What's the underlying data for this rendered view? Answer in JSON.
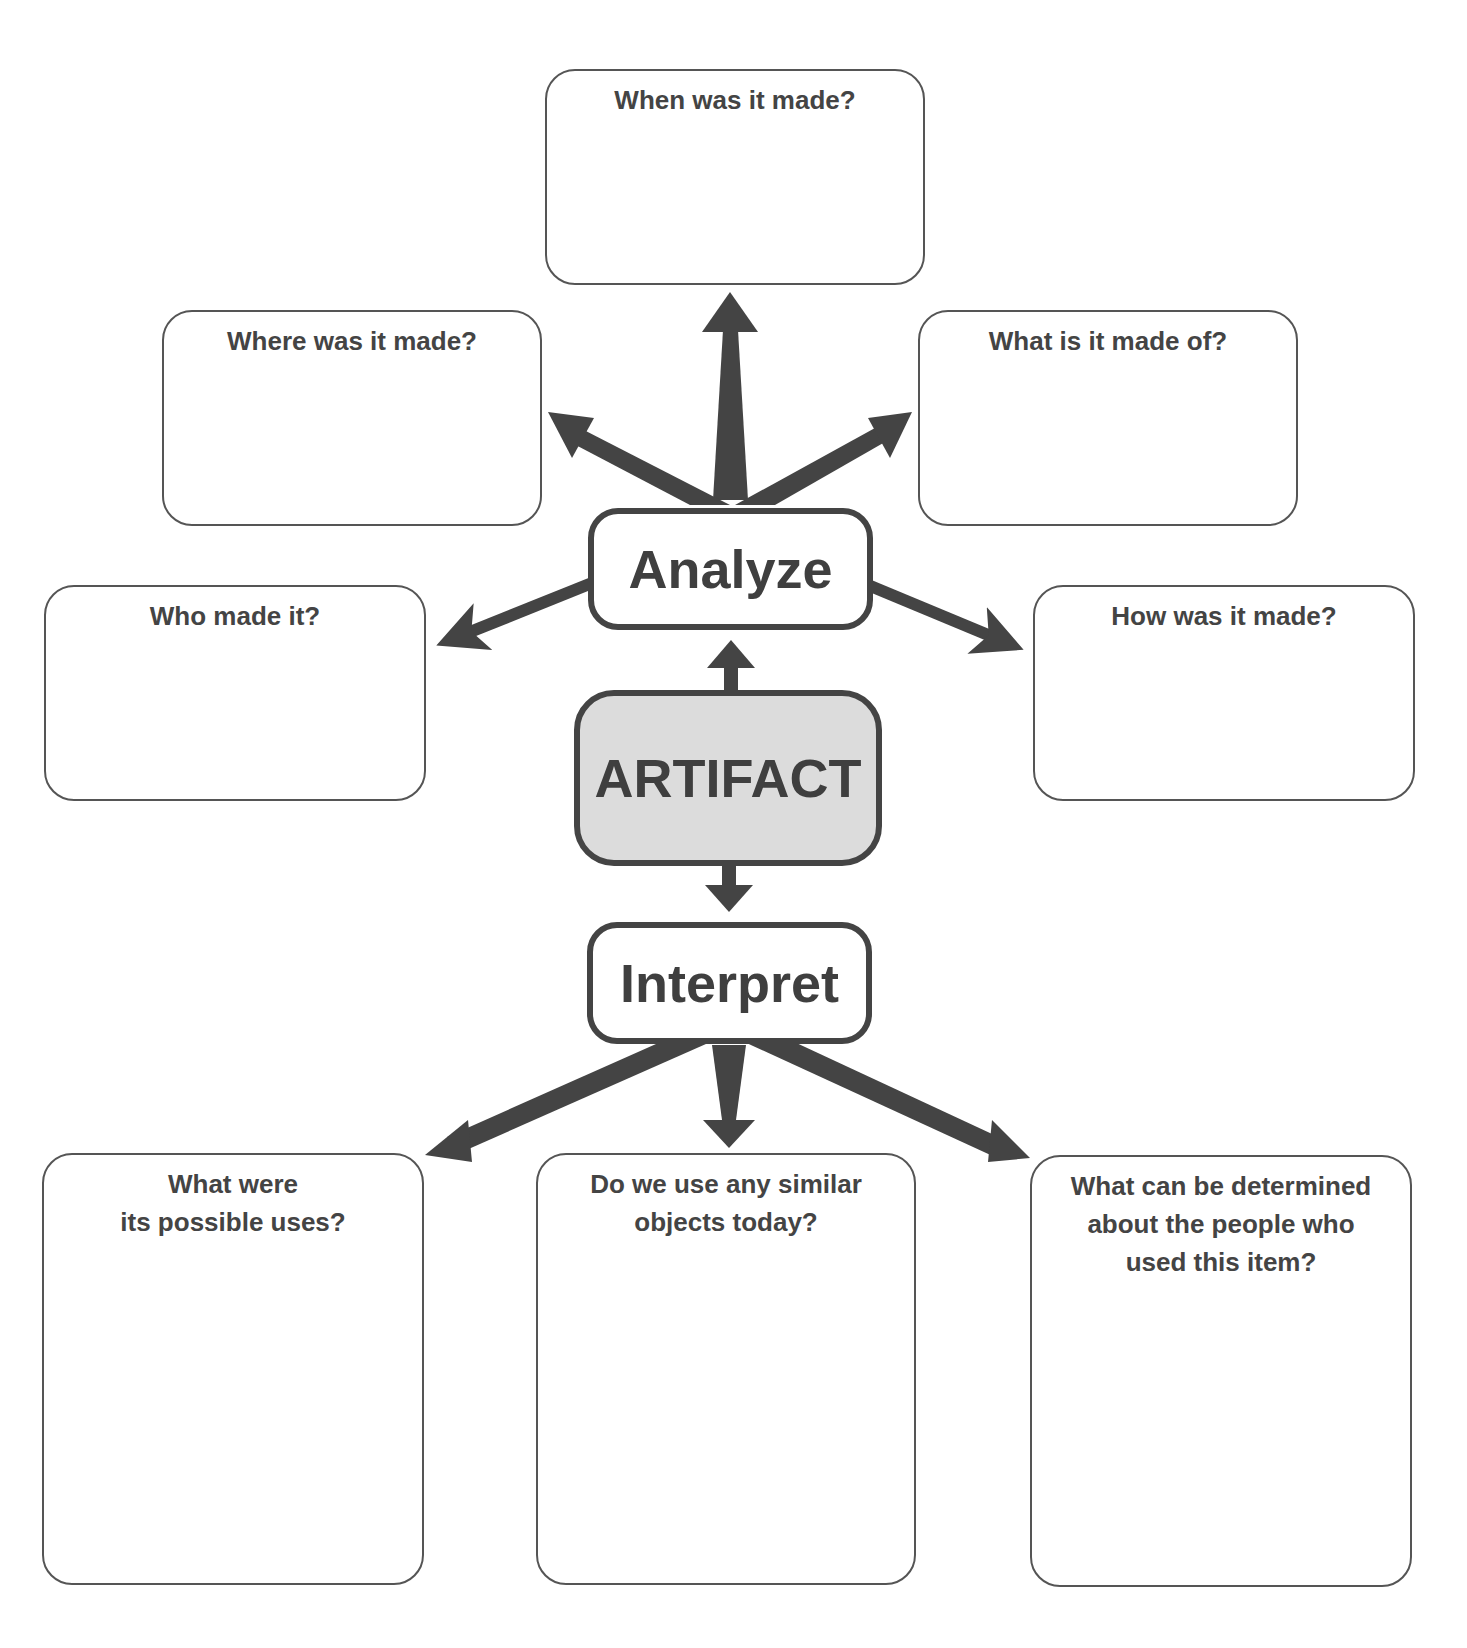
{
  "diagram": {
    "colors": {
      "arrow": "#444444",
      "box_border": "#555555",
      "text": "#444444",
      "artifact_fill": "#dcdcdc"
    },
    "center": {
      "label": "ARTIFACT"
    },
    "analyze": {
      "label": "Analyze",
      "questions": [
        "When was it made?",
        "Where was it made?",
        "What is it made of?",
        "Who made it?",
        "How was it made?"
      ]
    },
    "interpret": {
      "label": "Interpret",
      "questions": [
        "What were\nits possible uses?",
        "Do we use any similar\nobjects today?",
        "What can be determined\nabout the people who\nused this item?"
      ]
    }
  }
}
